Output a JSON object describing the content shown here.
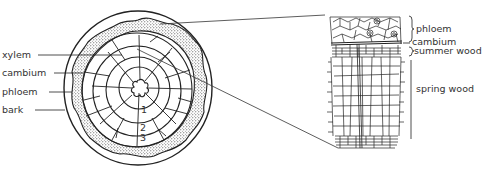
{
  "diagram": {
    "type": "cross-section of tree trunk with magnified detail",
    "left_labels": [
      {
        "text": "xylem",
        "y": 55
      },
      {
        "text": "cambium",
        "y": 73
      },
      {
        "text": "phloem",
        "y": 92
      },
      {
        "text": "bark",
        "y": 110
      }
    ],
    "ring_numbers": [
      "1",
      "2",
      "3"
    ],
    "right_labels": [
      {
        "text": "phloem",
        "y": 29
      },
      {
        "text": "cambium",
        "y": 42
      },
      {
        "text": "summer wood",
        "y": 51
      },
      {
        "text": "spring wood",
        "y": 89
      }
    ],
    "colors": {
      "line": "#222222",
      "text": "#333333",
      "background": "#ffffff"
    }
  }
}
